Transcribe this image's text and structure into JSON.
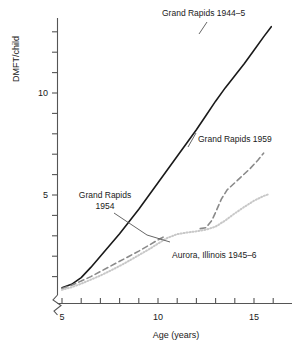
{
  "chart_data": {
    "type": "line",
    "title": "",
    "xlabel": "Age (years)",
    "ylabel": "DMFT/child",
    "xlim": [
      4.6,
      16.4
    ],
    "ylim": [
      0.0,
      13.8
    ],
    "xticks": [
      5,
      6,
      7,
      8,
      9,
      10,
      11,
      12,
      13,
      14,
      15,
      16
    ],
    "xticklabels": [
      "5",
      "",
      "",
      "",
      "",
      "10",
      "",
      "",
      "",
      "",
      "15",
      ""
    ],
    "yticks": [
      1,
      2,
      3,
      4,
      5,
      6,
      7,
      8,
      9,
      10,
      11,
      12,
      13
    ],
    "yticklabels": [
      "",
      "",
      "",
      "",
      "5",
      "",
      "",
      "",
      "",
      "10",
      "",
      "",
      ""
    ],
    "grid": false,
    "legend_position": "inline-annotations",
    "axis_break": "y-origin-zigzag",
    "series": [
      {
        "name": "Grand Rapids 1944-5",
        "style": "solid",
        "color": "#1a1a1a",
        "x": [
          5.0,
          5.5,
          6.0,
          6.5,
          7.0,
          7.5,
          8.0,
          8.5,
          9.0,
          9.5,
          10.0,
          10.5,
          11.0,
          11.5,
          12.0,
          12.5,
          13.0,
          13.5,
          14.0,
          14.5,
          15.0,
          15.5,
          15.9
        ],
        "y": [
          0.45,
          0.62,
          0.95,
          1.45,
          2.0,
          2.55,
          3.1,
          3.7,
          4.3,
          4.95,
          5.6,
          6.25,
          6.9,
          7.55,
          8.2,
          8.9,
          9.6,
          10.25,
          10.85,
          11.45,
          12.1,
          12.75,
          13.25
        ]
      },
      {
        "name": "Grand Rapids 1954",
        "style": "dashed",
        "color": "#8a8a8a",
        "x": [
          5.0,
          5.5,
          6.0,
          6.5,
          7.0,
          7.5,
          8.0,
          8.5,
          9.0,
          9.5,
          10.0,
          10.3
        ],
        "y": [
          0.42,
          0.58,
          0.78,
          1.0,
          1.25,
          1.5,
          1.75,
          2.0,
          2.25,
          2.52,
          2.8,
          2.95
        ]
      },
      {
        "name": "Grand Rapids 1959",
        "style": "dashed",
        "color": "#8a8a8a",
        "x": [
          12.2,
          12.5,
          12.8,
          13.0,
          13.3,
          13.6,
          14.0,
          14.4,
          14.8,
          15.2,
          15.5
        ],
        "y": [
          3.35,
          3.4,
          3.75,
          4.15,
          4.8,
          5.25,
          5.6,
          5.95,
          6.3,
          6.7,
          7.05
        ]
      },
      {
        "name": "Aurora, Illinois 1945-6",
        "style": "dotted",
        "color": "#c8c8c8",
        "x": [
          5.0,
          5.5,
          6.0,
          6.5,
          7.0,
          7.5,
          8.0,
          8.5,
          9.0,
          9.5,
          10.0,
          10.5,
          11.0,
          11.5,
          12.0,
          12.5,
          13.0,
          13.5,
          14.0,
          14.5,
          15.0,
          15.5,
          15.8
        ],
        "y": [
          0.35,
          0.48,
          0.65,
          0.85,
          1.05,
          1.28,
          1.52,
          1.78,
          2.05,
          2.32,
          2.62,
          2.9,
          3.08,
          3.16,
          3.22,
          3.3,
          3.45,
          3.75,
          4.1,
          4.42,
          4.72,
          4.95,
          5.05
        ]
      }
    ],
    "annotations": [
      {
        "id": "lbl-1944",
        "text": "Grand Rapids 1944–5"
      },
      {
        "id": "lbl-1959",
        "text": "Grand Rapids 1959"
      },
      {
        "id": "lbl-1954",
        "text": "Grand Rapids\n1954"
      },
      {
        "id": "lbl-1954-line1",
        "text": "Grand Rapids"
      },
      {
        "id": "lbl-1954-line2",
        "text": "1954"
      },
      {
        "id": "lbl-aurora",
        "text": "Aurora, Illinois 1945–6"
      }
    ]
  },
  "axes": {
    "x_title": "Age (years)",
    "y_title": "DMFT/child",
    "x_tick_5": "5",
    "x_tick_10": "10",
    "x_tick_15": "15",
    "y_tick_5": "5",
    "y_tick_10": "10"
  },
  "colors": {
    "axis": "#555555",
    "series_1944": "#1a1a1a",
    "series_1954": "#8a8a8a",
    "series_1959": "#8a8a8a",
    "series_aurora": "#c8c8c8",
    "leader": "#555555",
    "background": "#ffffff"
  }
}
